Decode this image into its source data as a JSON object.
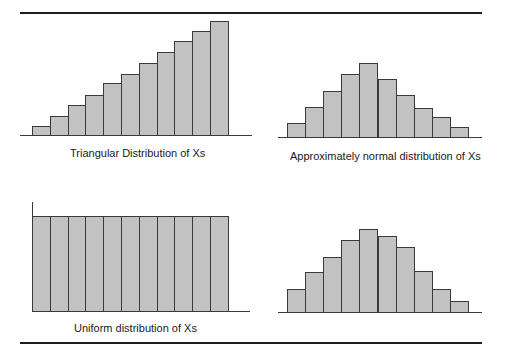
{
  "figure": {
    "captions": {
      "triangular": "Triangular Distribution of Xs",
      "normal_top": "Approximately normal distribution of Xs",
      "uniform": "Uniform distribution of Xs"
    }
  },
  "colors": {
    "bar_fill": "#c2c2c2",
    "bar_edge": "#3a3a3a",
    "rule": "#1e1e1e"
  },
  "chart_data": [
    {
      "type": "bar",
      "title": "Triangular Distribution of Xs",
      "categories": [
        "1",
        "2",
        "3",
        "4",
        "5",
        "6",
        "7",
        "8",
        "9",
        "10",
        "11"
      ],
      "values": [
        9,
        19,
        30,
        40,
        52,
        61,
        72,
        83,
        94,
        104,
        114
      ],
      "xlabel": "",
      "ylabel": "",
      "grid": false,
      "axis_ticks": false
    },
    {
      "type": "bar",
      "title": "Approximately normal distribution of Xs",
      "categories": [
        "1",
        "2",
        "3",
        "4",
        "5",
        "6",
        "7",
        "8",
        "9",
        "10"
      ],
      "values": [
        14,
        30,
        46,
        63,
        74,
        58,
        42,
        29,
        20,
        10
      ],
      "xlabel": "",
      "ylabel": "",
      "grid": false,
      "axis_ticks": false
    },
    {
      "type": "bar",
      "title": "Uniform distribution of Xs",
      "categories": [
        "1",
        "2",
        "3",
        "4",
        "5",
        "6",
        "7",
        "8",
        "9",
        "10",
        "11"
      ],
      "values": [
        95,
        95,
        95,
        95,
        95,
        95,
        95,
        95,
        95,
        95,
        95
      ],
      "xlabel": "",
      "ylabel": "",
      "grid": false,
      "axis_ticks": false
    },
    {
      "type": "bar",
      "title": "",
      "categories": [
        "1",
        "2",
        "3",
        "4",
        "5",
        "6",
        "7",
        "8",
        "9",
        "10"
      ],
      "values": [
        23,
        40,
        55,
        72,
        83,
        76,
        65,
        41,
        23,
        11
      ],
      "xlabel": "",
      "ylabel": "",
      "grid": false,
      "axis_ticks": false
    }
  ]
}
